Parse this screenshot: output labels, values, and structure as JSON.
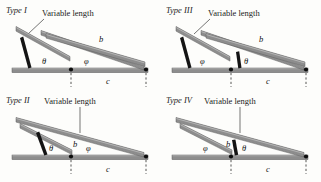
{
  "figure": {
    "name": "four-bar-linkage-types",
    "background": "#fdfdfb",
    "bar_color": "#8d8d8d",
    "crank_color": "#141414",
    "pivot_color": "#0d0d0d"
  },
  "labels": {
    "variable_length": "Variable length",
    "theta": "θ",
    "phi": "φ",
    "b": "b",
    "c": "c"
  },
  "panels": [
    {
      "id": "type-1",
      "title": "Type I",
      "variable_length": "Variable length",
      "leader": "diagonal",
      "angles": {
        "left": "θ",
        "right": "φ"
      },
      "links": {
        "b": "b",
        "c": "c"
      },
      "b_length": "long",
      "crank_side": "left-outside"
    },
    {
      "id": "type-3",
      "title": "Type III",
      "variable_length": "Variable length",
      "leader": "diagonal",
      "angles": {
        "left": "φ",
        "right": "θ"
      },
      "links": {
        "b": "b",
        "c": "c"
      },
      "b_length": "long",
      "crank_side": "left-outside"
    },
    {
      "id": "type-2",
      "title": "Type II",
      "variable_length": "Variable length",
      "leader": "vertical",
      "angles": {
        "left": "θ",
        "right": "φ"
      },
      "links": {
        "b": "b",
        "c": "c"
      },
      "b_length": "short",
      "crank_side": "inside"
    },
    {
      "id": "type-4",
      "title": "Type IV",
      "variable_length": "Variable length",
      "leader": "vertical",
      "angles": {
        "left": "φ",
        "right": "θ"
      },
      "links": {
        "b": "b",
        "c": "c"
      },
      "b_length": "short",
      "crank_side": "inside"
    }
  ]
}
